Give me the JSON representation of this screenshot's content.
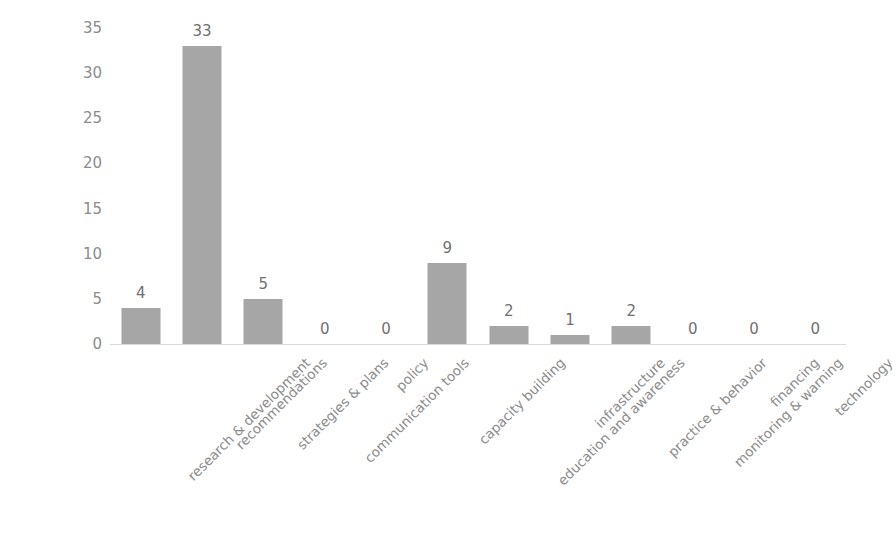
{
  "chart_data": {
    "type": "bar",
    "title": "",
    "xlabel": "",
    "ylabel": "",
    "categories": [
      "research & development",
      "recommendations",
      "strategies & plans",
      "communication tools",
      "policy",
      "capacity building",
      "education and awareness",
      "infrastructure",
      "practice & behavior",
      "monitoring & warning",
      "financing",
      "technology"
    ],
    "values": [
      4,
      33,
      5,
      0,
      0,
      9,
      2,
      1,
      2,
      0,
      0,
      0
    ],
    "data_labels": [
      "4",
      "33",
      "5",
      "0",
      "0",
      "9",
      "2",
      "1",
      "2",
      "0",
      "0",
      "0"
    ],
    "y_ticks": [
      "0",
      "5",
      "10",
      "15",
      "20",
      "25",
      "30",
      "35"
    ],
    "ylim": [
      0,
      35
    ],
    "grid": false,
    "legend": false,
    "legend_position": "none",
    "bar_color": "#a6a6a6",
    "axis_color": "#d9d9d9",
    "tick_label_color": "#8c8c8c",
    "data_label_color": "#707070"
  }
}
